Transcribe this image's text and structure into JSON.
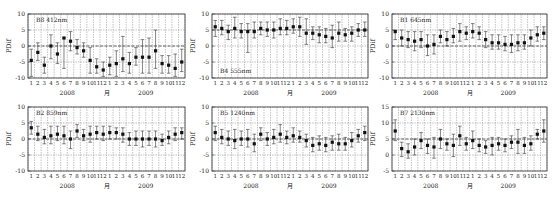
{
  "chart_data": [
    {
      "type": "scatter",
      "subtype": "errorbar",
      "title": "B8 412nm",
      "panel_label": "B8 412nm",
      "label_position": "top-left",
      "ylabel": "PDif",
      "xlabel": "月",
      "x_groups": [
        "2008",
        "2009"
      ],
      "categories": [
        "1",
        "2",
        "3",
        "4",
        "5",
        "6",
        "7",
        "8",
        "9",
        "10",
        "11",
        "12",
        "1",
        "2",
        "3",
        "4",
        "5",
        "6",
        "7",
        "8",
        "9",
        "10",
        "11",
        "12"
      ],
      "ylim": [
        -10,
        10
      ],
      "yticks": [
        -10,
        -5,
        0,
        5,
        10
      ],
      "ref_line": 0,
      "grid": true,
      "values": [
        -4.5,
        -2,
        -6,
        0,
        -2.5,
        2.5,
        1.5,
        -0.5,
        -1.5,
        -4.5,
        -6.5,
        -7.5,
        -6,
        -5.5,
        -4,
        -5.5,
        -3.5,
        -3.5,
        -3.5,
        -1.5,
        -5.5,
        -6,
        -7,
        -5
      ],
      "err_low": [
        -9.5,
        -4.5,
        -8.5,
        -4,
        -5.5,
        -7,
        -1.5,
        -2.5,
        -3.5,
        -8.5,
        -8.5,
        -9.5,
        -9,
        -9.5,
        -8,
        -8.5,
        -6,
        -8.5,
        -8.5,
        -7,
        -8.5,
        -8.5,
        -9.5,
        -8
      ],
      "err_high": [
        -1,
        1,
        -3.5,
        3.5,
        1,
        2.5,
        4.5,
        2,
        1,
        -0.5,
        -4,
        -5,
        -3.5,
        -1.5,
        3,
        -2,
        -0.5,
        2,
        2.5,
        5,
        -3,
        -3,
        -2.5,
        -1
      ]
    },
    {
      "type": "scatter",
      "subtype": "errorbar",
      "title": "B4 555nm",
      "panel_label": "B4 555nm",
      "label_position": "bottom-left",
      "ylabel": "PDif",
      "xlabel": "月",
      "x_groups": [
        "2008",
        "2009"
      ],
      "categories": [
        "1",
        "2",
        "3",
        "4",
        "5",
        "6",
        "7",
        "8",
        "9",
        "10",
        "11",
        "12",
        "1",
        "2",
        "3",
        "4",
        "5",
        "6",
        "7",
        "8",
        "9",
        "10",
        "11",
        "12"
      ],
      "ylim": [
        -10,
        10
      ],
      "yticks": [
        -10,
        -5,
        0,
        5,
        10
      ],
      "ref_line": 5,
      "grid": true,
      "values": [
        6,
        5.5,
        4.5,
        5.5,
        4.5,
        4.5,
        4.5,
        5.5,
        5,
        5,
        5.5,
        5.5,
        6,
        6,
        4,
        4,
        3.5,
        3,
        2.5,
        4,
        3.5,
        4,
        5,
        5
      ],
      "err_low": [
        3,
        3.5,
        2,
        2.5,
        2.5,
        -2,
        2.5,
        3.5,
        3,
        2.5,
        3.5,
        3.5,
        4,
        3,
        0.5,
        2,
        1,
        1,
        -0.5,
        1.5,
        1.5,
        1.5,
        3,
        3
      ],
      "err_high": [
        8,
        8,
        6.5,
        9,
        7,
        7,
        7.5,
        7.5,
        7.5,
        7.5,
        8.5,
        8,
        8.5,
        9,
        8.5,
        6,
        6,
        5.5,
        6.5,
        7.5,
        5.5,
        6,
        7,
        7.5
      ]
    },
    {
      "type": "scatter",
      "subtype": "errorbar",
      "title": "B1 645nm",
      "panel_label": "B1 645nm",
      "label_position": "top-left",
      "ylabel": "PDif",
      "xlabel": "月",
      "x_groups": [
        "2008",
        "2009"
      ],
      "categories": [
        "1",
        "2",
        "3",
        "4",
        "5",
        "6",
        "7",
        "8",
        "9",
        "10",
        "11",
        "12",
        "1",
        "2",
        "3",
        "4",
        "5",
        "6",
        "7",
        "8",
        "9",
        "10",
        "11",
        "12"
      ],
      "ylim": [
        -10,
        10
      ],
      "yticks": [
        -10,
        -5,
        0,
        5,
        10
      ],
      "ref_line": 0,
      "grid": true,
      "values": [
        4.5,
        2.5,
        2,
        1.5,
        2,
        0,
        0.5,
        3,
        2,
        3,
        4.5,
        4,
        4.5,
        4,
        2,
        1,
        1,
        0.5,
        0.5,
        1,
        1,
        2.5,
        3.5,
        4
      ],
      "err_low": [
        2,
        0,
        -0.5,
        -1.5,
        -0.5,
        -3,
        -2.5,
        1,
        0,
        1,
        1.5,
        2,
        2.5,
        2,
        -0.5,
        -1,
        -1,
        -1.5,
        -2,
        -1.5,
        -1,
        0,
        1.5,
        2
      ],
      "err_high": [
        5,
        5,
        4.5,
        4.5,
        4.5,
        3.5,
        3.5,
        5,
        4.5,
        5.5,
        7,
        6,
        7,
        6,
        4.5,
        3.5,
        3.5,
        3,
        3.5,
        3.5,
        3.5,
        5,
        6,
        6
      ]
    },
    {
      "type": "scatter",
      "subtype": "errorbar",
      "title": "B2 859nm",
      "panel_label": "B2 859nm",
      "label_position": "top-left",
      "ylabel": "PDif",
      "xlabel": "月",
      "x_groups": [
        "2008",
        "2009"
      ],
      "categories": [
        "1",
        "2",
        "3",
        "4",
        "5",
        "6",
        "7",
        "8",
        "9",
        "10",
        "11",
        "12",
        "1",
        "2",
        "3",
        "4",
        "5",
        "6",
        "7",
        "8",
        "9",
        "10",
        "11",
        "12"
      ],
      "ylim": [
        -10,
        10
      ],
      "yticks": [
        -10,
        -5,
        0,
        5,
        10
      ],
      "ref_line": 0,
      "grid": true,
      "values": [
        3.5,
        1.5,
        0.5,
        1,
        1.5,
        1,
        0,
        2.5,
        1,
        1.5,
        2,
        1.5,
        2,
        2,
        1.5,
        0,
        0,
        0,
        0,
        0,
        -0.5,
        0.5,
        1.5,
        2
      ],
      "err_low": [
        1.5,
        -0.5,
        -1.5,
        -1.5,
        -0.5,
        -1.5,
        -3,
        0.5,
        -0.5,
        -1,
        0,
        -0.5,
        0,
        0,
        -1,
        -2,
        -2,
        -2.5,
        -2,
        -2.5,
        -2,
        -1.5,
        -0.5,
        0
      ],
      "err_high": [
        5.5,
        4,
        3,
        4,
        4,
        4,
        2.5,
        4.5,
        3,
        4,
        4,
        4,
        4,
        3.5,
        3.5,
        2,
        2.5,
        2.5,
        2.5,
        2.5,
        1.5,
        2.5,
        3.5,
        3.5
      ]
    },
    {
      "type": "scatter",
      "subtype": "errorbar",
      "title": "B5 1240nm",
      "panel_label": "B5 1240nm",
      "label_position": "top-left",
      "ylabel": "PDif",
      "xlabel": "月",
      "x_groups": [
        "2008",
        "2009"
      ],
      "categories": [
        "1",
        "2",
        "3",
        "4",
        "5",
        "6",
        "7",
        "8",
        "9",
        "10",
        "11",
        "12",
        "1",
        "2",
        "3",
        "4",
        "5",
        "6",
        "7",
        "8",
        "9",
        "10",
        "11",
        "12"
      ],
      "ylim": [
        -10,
        10
      ],
      "yticks": [
        -10,
        -5,
        0,
        5,
        10
      ],
      "ref_line": 0,
      "grid": true,
      "values": [
        2,
        0.5,
        0,
        -0.5,
        0,
        0,
        -1.5,
        1.5,
        0,
        0.5,
        1.5,
        0.5,
        1,
        0.5,
        -0.5,
        -2,
        -1.5,
        -2,
        -1,
        -1.5,
        -1.5,
        -0.5,
        1,
        2
      ],
      "err_low": [
        -0.5,
        -1.5,
        -2,
        -3,
        -2,
        -2.5,
        -4,
        -0.5,
        -2,
        -1.5,
        -1,
        -1.5,
        -1,
        -1,
        -2.5,
        -4,
        -3.5,
        -4,
        -3.5,
        -3.5,
        -3.5,
        -2.5,
        -1,
        -0.5
      ],
      "err_high": [
        4,
        3,
        2.5,
        3,
        2.5,
        3,
        1.5,
        3.5,
        2,
        3,
        4.5,
        2.5,
        3.5,
        2.5,
        1.5,
        0.5,
        1,
        0.5,
        1,
        1.5,
        0.5,
        2,
        3,
        4
      ]
    },
    {
      "type": "scatter",
      "subtype": "errorbar",
      "title": "B7 2130nm",
      "panel_label": "B7 2130nm",
      "label_position": "top-left",
      "ylabel": "PDif",
      "xlabel": "月",
      "x_groups": [
        "2008",
        "2009"
      ],
      "categories": [
        "1",
        "2",
        "3",
        "4",
        "5",
        "6",
        "7",
        "8",
        "9",
        "10",
        "11",
        "12",
        "1",
        "2",
        "3",
        "4",
        "5",
        "6",
        "7",
        "8",
        "9",
        "10",
        "11",
        "12"
      ],
      "ylim": [
        -5,
        15
      ],
      "yticks": [
        -5,
        0,
        5,
        10,
        15
      ],
      "ref_line": 5,
      "grid": true,
      "values": [
        7.5,
        2,
        1,
        2.5,
        4.5,
        3,
        2.5,
        5,
        3.5,
        3,
        6,
        3.5,
        4.5,
        3,
        2.5,
        3,
        3.5,
        3,
        4,
        4,
        3,
        3.5,
        6.5,
        7.5
      ],
      "err_low": [
        4.5,
        -0.5,
        -1,
        0,
        2,
        0.5,
        -1,
        2,
        1.5,
        -0.5,
        3,
        1.5,
        2,
        1,
        0.5,
        0,
        1.5,
        1,
        2,
        0.5,
        0.5,
        1.5,
        5,
        4
      ],
      "err_high": [
        11,
        4,
        3.5,
        5,
        7,
        5,
        5.5,
        8,
        5,
        6.5,
        9,
        5.5,
        7.5,
        5,
        4.5,
        5.5,
        5.5,
        5,
        6,
        8,
        5.5,
        6,
        8,
        11
      ]
    }
  ]
}
